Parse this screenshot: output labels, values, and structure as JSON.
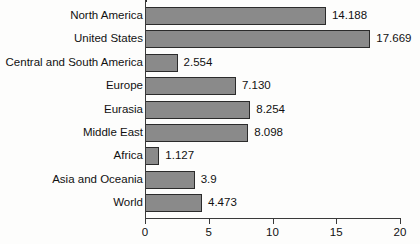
{
  "chart_data": {
    "type": "bar",
    "orientation": "horizontal",
    "title": "",
    "subtitle": "",
    "xlabel": "",
    "ylabel": "",
    "xlim": [
      0,
      20
    ],
    "xticks": [
      "0",
      "5",
      "10",
      "15",
      "20"
    ],
    "xtick_values": [
      0,
      5,
      10,
      15,
      20
    ],
    "grid": false,
    "legend": false,
    "bar_color": "#8a8a8a",
    "bar_border_color": "#2b2b2b",
    "axis_color": "#3a3a3a",
    "background_color": "#fdfdfc",
    "text_color": "#111111",
    "categories": [
      "North America",
      "United States",
      "Central and South America",
      "Europe",
      "Eurasia",
      "Middle East",
      "Africa",
      "Asia and Oceania",
      "World"
    ],
    "values": [
      14.188,
      17.669,
      2.554,
      7.13,
      8.254,
      8.098,
      1.127,
      3.9,
      4.473
    ],
    "value_labels": [
      "14.188",
      "17.669",
      "2.554",
      "7.130",
      "8.254",
      "8.098",
      "1.127",
      "3.9",
      "4.473"
    ],
    "bars": [
      {
        "category": "North America",
        "value": 14.188,
        "label": "14.188"
      },
      {
        "category": "United States",
        "value": 17.669,
        "label": "17.669"
      },
      {
        "category": "Central and South America",
        "value": 2.554,
        "label": "2.554"
      },
      {
        "category": "Europe",
        "value": 7.13,
        "label": "7.130"
      },
      {
        "category": "Eurasia",
        "value": 8.254,
        "label": "8.254"
      },
      {
        "category": "Middle East",
        "value": 8.098,
        "label": "8.098"
      },
      {
        "category": "Africa",
        "value": 1.127,
        "label": "1.127"
      },
      {
        "category": "Asia and Oceania",
        "value": 3.9,
        "label": "3.9"
      },
      {
        "category": "World",
        "value": 4.473,
        "label": "4.473"
      }
    ]
  }
}
